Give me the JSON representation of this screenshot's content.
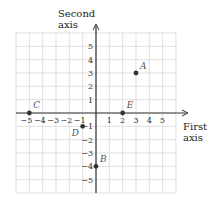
{
  "axes": {
    "x_title_line1": "First",
    "x_title_line2": "axis",
    "y_title_line1": "Second",
    "y_title_line2": "axis",
    "x_ticks": [
      "-5",
      "-4",
      "-3",
      "-2",
      "-1",
      "1",
      "2",
      "3",
      "4",
      "5"
    ],
    "y_ticks": [
      "5",
      "4",
      "3",
      "2",
      "1",
      "-1",
      "-2",
      "-3",
      "-4",
      "-5"
    ]
  },
  "points": [
    {
      "label": "A",
      "x": 3,
      "y": 3
    },
    {
      "label": "B",
      "x": 0,
      "y": -4
    },
    {
      "label": "C",
      "x": -5,
      "y": 0
    },
    {
      "label": "D",
      "x": -1,
      "y": -1
    },
    {
      "label": "E",
      "x": 2,
      "y": 0
    }
  ],
  "chart_data": {
    "type": "scatter",
    "title": "",
    "xlabel": "First axis",
    "ylabel": "Second axis",
    "xlim": [
      -6,
      6
    ],
    "ylim": [
      -6,
      6
    ],
    "grid": true,
    "x_ticks": [
      -5,
      -4,
      -3,
      -2,
      -1,
      1,
      2,
      3,
      4,
      5
    ],
    "y_ticks": [
      -5,
      -4,
      -3,
      -2,
      -1,
      1,
      2,
      3,
      4,
      5
    ],
    "series": [
      {
        "name": "points",
        "labels": [
          "A",
          "B",
          "C",
          "D",
          "E"
        ],
        "x": [
          3,
          0,
          -5,
          -1,
          2
        ],
        "y": [
          3,
          -4,
          0,
          -1,
          0
        ]
      }
    ]
  },
  "colors": {
    "grid": "#d9d9d9",
    "axis": "#333333",
    "point": "#333333"
  }
}
